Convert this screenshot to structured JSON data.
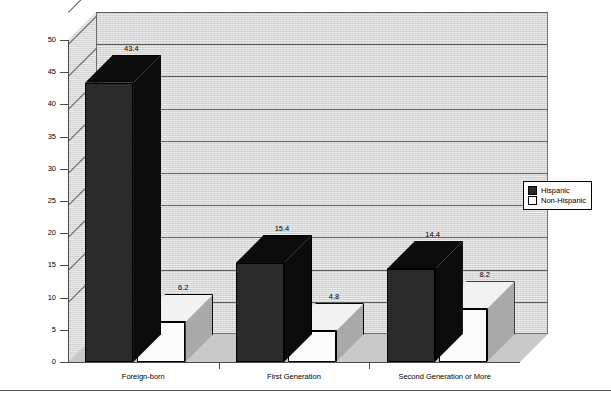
{
  "chart_data": {
    "type": "bar",
    "title": "",
    "subtitle": "",
    "xlabel": "",
    "ylabel": "",
    "categories": [
      "Foreign-born",
      "First Generation",
      "Second Generation or More"
    ],
    "series": [
      {
        "name": "Hispanic",
        "values": [
          43.4,
          15.4,
          14.4
        ],
        "color": "#2b2b2b"
      },
      {
        "name": "Non-Hispanic",
        "values": [
          6.2,
          4.8,
          8.2
        ],
        "color": "#ffffff"
      }
    ],
    "ylim": [
      0,
      50
    ],
    "ytick_step": 5,
    "ytick_labels": [
      "0",
      "5",
      "10",
      "15",
      "20",
      "25",
      "30",
      "35",
      "40",
      "45",
      "50"
    ],
    "data_labels": [
      "43.4",
      "6.2",
      "15.4",
      "4.8",
      "14.4",
      "8.2"
    ],
    "grid": true,
    "grid_axis": "y",
    "legend_position": "right",
    "three_d": true,
    "plot_background": "#d4d4d4"
  },
  "legend": {
    "items": [
      {
        "label": "Hispanic",
        "style": "dark"
      },
      {
        "label": "Non-Hispanic",
        "style": "light"
      }
    ]
  }
}
